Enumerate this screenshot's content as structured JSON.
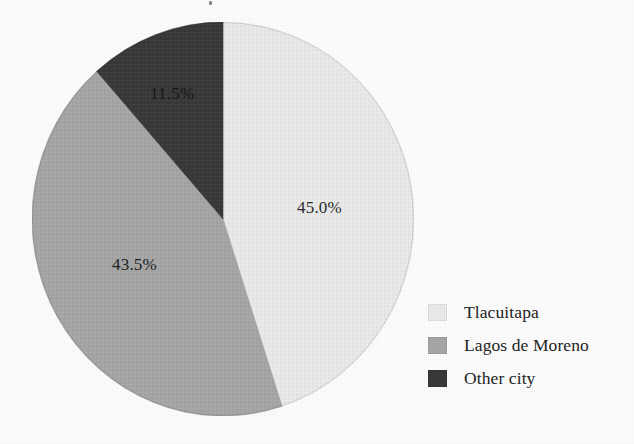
{
  "chart_data": {
    "type": "pie",
    "title": "",
    "subtitle": "",
    "xlabel": "",
    "ylabel": "",
    "grid": false,
    "legend_position": "right",
    "start_angle_deg": 0,
    "direction": "clockwise",
    "categories": [
      "Tlacuitapa",
      "Lagos de Moreno",
      "Other city"
    ],
    "values": [
      45.0,
      43.5,
      11.5
    ],
    "value_unit": "%",
    "data_labels": [
      "45.0%",
      "43.5%",
      "11.5%"
    ],
    "colors": [
      "#ececec",
      "#a8a8a8",
      "#3a3a3a"
    ],
    "slices": [
      {
        "name": "Tlacuitapa",
        "value": 45.0,
        "label": "45.0%",
        "color": "#ececec",
        "start_deg": 0.0,
        "end_deg": 162.0
      },
      {
        "name": "Lagos de Moreno",
        "value": 43.5,
        "label": "43.5%",
        "color": "#a8a8a8",
        "start_deg": 162.0,
        "end_deg": 318.6
      },
      {
        "name": "Other city",
        "value": 11.5,
        "label": "11.5%",
        "color": "#3a3a3a",
        "start_deg": 318.6,
        "end_deg": 360.0
      }
    ]
  },
  "legend": {
    "items": [
      {
        "label": "Tlacuitapa",
        "color": "#ececec",
        "swatch_name": "legend-swatch-tlacuitapa"
      },
      {
        "label": "Lagos de Moreno",
        "color": "#a8a8a8",
        "swatch_name": "legend-swatch-lagos-de-moreno"
      },
      {
        "label": "Other city",
        "color": "#3a3a3a",
        "swatch_name": "legend-swatch-other-city"
      }
    ]
  },
  "labels": {
    "tlacuitapa_pct": "45.0%",
    "lagos_pct": "43.5%",
    "other_pct": "11.5%"
  },
  "style": {
    "background": "#ffffff",
    "text_color": "#242424"
  }
}
